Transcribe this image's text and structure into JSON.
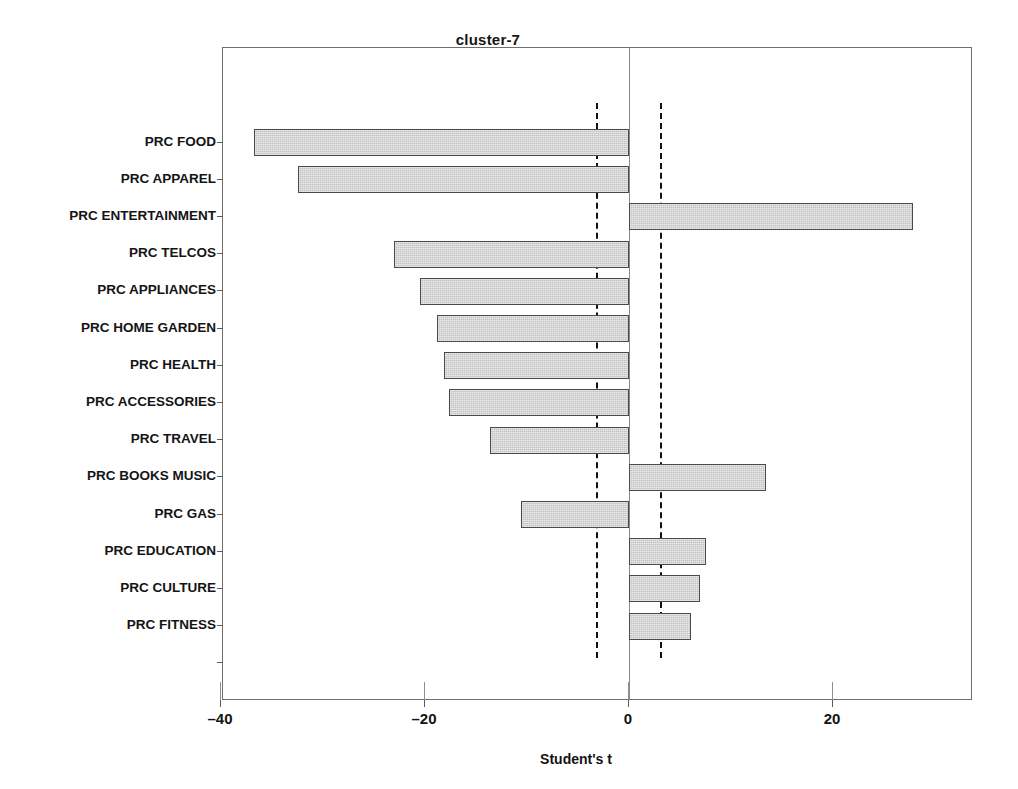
{
  "chart_data": {
    "type": "bar",
    "orientation": "horizontal",
    "title": "cluster-7",
    "xlabel": "Student's t",
    "ylabel": "",
    "xlim": [
      -40.5,
      33.5
    ],
    "xticks": [
      -40,
      -20,
      0,
      20
    ],
    "xticklabels": [
      "–40",
      "–20",
      "0",
      "20"
    ],
    "grid": false,
    "legend": null,
    "reference_lines": [
      -3.2,
      3.0
    ],
    "zero_line": 0,
    "categories": [
      "PRC FOOD",
      "PRC APPAREL",
      "PRC ENTERTAINMENT",
      "PRC TELCOS",
      "PRC APPLIANCES",
      "PRC HOME GARDEN",
      "PRC HEALTH",
      "PRC ACCESSORIES",
      "PRC TRAVEL",
      "PRC BOOKS MUSIC",
      "PRC GAS",
      "PRC EDUCATION",
      "PRC CULTURE",
      "PRC FITNESS"
    ],
    "values": [
      -36.8,
      -32.5,
      27.8,
      -23.0,
      -20.5,
      -18.8,
      -18.1,
      -17.6,
      -13.6,
      13.4,
      -10.6,
      7.5,
      7.0,
      6.1
    ],
    "bar_color": "#c3c3c3",
    "bar_edge_color": "#4a4a4a"
  },
  "axes": {
    "frame_color": "#6e6e6e",
    "tick_color": "#5d5d5d",
    "reference_line_color": "#111111"
  }
}
